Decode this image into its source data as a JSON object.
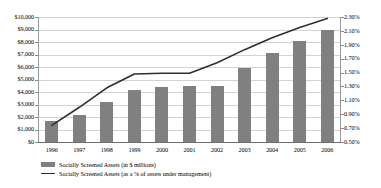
{
  "chart_data": {
    "type": "bar",
    "title": "",
    "subtitle": "",
    "xlabel": "",
    "ylabel": "",
    "grid": true,
    "legend_position": "bottom-left",
    "categories": [
      "1996",
      "1997",
      "1998",
      "1999",
      "2000",
      "2001",
      "2002",
      "2003",
      "2004",
      "2005",
      "2006"
    ],
    "axes": {
      "left": {
        "label": "",
        "ylim": [
          0,
          10000
        ],
        "tick_values": [
          0,
          1000,
          2000,
          3000,
          4000,
          5000,
          6000,
          7000,
          8000,
          9000,
          10000
        ],
        "ticks": [
          "$0",
          "$1,000",
          "$2,000",
          "$3,000",
          "$4,000",
          "$5,000",
          "$6,000",
          "$7,000",
          "$8,000",
          "$9,000",
          "$10,000"
        ]
      },
      "right": {
        "label": "",
        "ylim": [
          0.5,
          2.3
        ],
        "tick_values": [
          0.5,
          0.7,
          0.9,
          1.1,
          1.3,
          1.5,
          1.7,
          1.9,
          2.1,
          2.3
        ],
        "ticks": [
          "0.50%",
          "0.70%",
          "0.90%",
          "1.10%",
          "1.30%",
          "1.50%",
          "1.70%",
          "1.90%",
          "2.10%",
          "2.30%"
        ]
      }
    },
    "series": [
      {
        "name": "Socially Screened Assets (in $ millions)",
        "type": "bar",
        "axis": "left",
        "color": "#808080",
        "values": [
          1700,
          2200,
          3200,
          4200,
          4400,
          4500,
          4500,
          5900,
          7100,
          8100,
          9000
        ]
      },
      {
        "name": "Socially Screened Assets (as a % of assets under management)",
        "type": "line",
        "axis": "right",
        "color": "#2f2f2f",
        "values": [
          0.74,
          1.0,
          1.28,
          1.48,
          1.49,
          1.49,
          1.64,
          1.83,
          2.0,
          2.15,
          2.28
        ]
      }
    ]
  },
  "legend": {
    "items": [
      {
        "marker": "bar-swatch",
        "label": "Socially Screened Assets (in $ millions)"
      },
      {
        "marker": "line-swatch",
        "label": "Socially Screened Assets (as a % of assets under management)"
      }
    ]
  },
  "colors": {
    "bar": "#808080",
    "line": "#2f2f2f",
    "gridline": "#d2d2d2",
    "axis": "#6e6e6e",
    "background": "#ffffff"
  }
}
